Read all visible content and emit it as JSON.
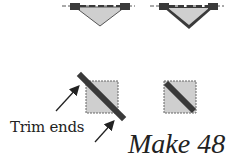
{
  "diagram": {
    "labels": {
      "trim_ends": "Trim ends",
      "make_count": "Make 48"
    },
    "colors": {
      "fabric_light": "#cfcfcf",
      "fabric_dark": "#3a3a3a",
      "outline": "#555555",
      "text": "#222222"
    },
    "elements": [
      "folded-triangle-unit-1",
      "folded-triangle-unit-2",
      "square-with-diagonal-strip-trim",
      "square-with-diagonal-strip-finished"
    ]
  }
}
